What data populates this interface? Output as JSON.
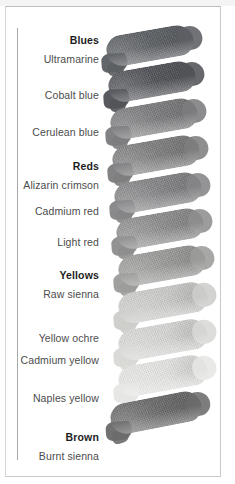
{
  "figure": {
    "title_visible": false,
    "background_color": "#ffffff",
    "frame_color": "#c9c9c9",
    "rule_color": "#a9a9a9",
    "label_color": "#4c4c4c",
    "group_label_color": "#1d1d1d"
  },
  "chart_data": {
    "type": "table",
    "title": "",
    "subtitle": "",
    "xlabel": "",
    "ylabel": "",
    "legend_position": "none",
    "grid": false,
    "categories": [
      "Ultramarine",
      "Cobalt blue",
      "Cerulean blue",
      "Alizarin crimson",
      "Cadmium red",
      "Light red",
      "Raw sienna",
      "Yellow ochre",
      "Cadmium yellow",
      "Naples yellow",
      "Burnt sienna"
    ],
    "groups": [
      "Blues",
      "Reds",
      "Yellows",
      "Brown"
    ],
    "series": [
      {
        "name": "swatch tone (0 = black, 255 = white)",
        "values": [
          92,
          82,
          124,
          126,
          133,
          142,
          156,
          205,
          216,
          230,
          107
        ]
      }
    ],
    "swatch_colors": [
      "#5c5f63",
      "#525358",
      "#7c7c7e",
      "#7e7e80",
      "#858587",
      "#8e8e8e",
      "#9c9c9a",
      "#cdcdcb",
      "#d8d8d6",
      "#e6e6e4",
      "#6b6b6b"
    ]
  },
  "rows": [
    {
      "group": "Blues",
      "name": "Ultramarine",
      "color": "#5c5f63",
      "top": 30
    },
    {
      "group": "",
      "name": "Cobalt blue",
      "color": "#525358",
      "top": 66
    },
    {
      "group": "",
      "name": "Cerulean blue",
      "color": "#7c7c7e",
      "top": 103
    },
    {
      "group": "Reds",
      "name": "Alizarin crimson",
      "color": "#7e7e80",
      "top": 140
    },
    {
      "group": "",
      "name": "Cadmium red",
      "color": "#858587",
      "top": 177
    },
    {
      "group": "",
      "name": "Light red",
      "color": "#8e8e8e",
      "top": 213
    },
    {
      "group": "Yellows",
      "name": "Raw sienna",
      "color": "#9c9c9a",
      "top": 250
    },
    {
      "group": "",
      "name": "Yellow ochre",
      "color": "#cdcdcb",
      "top": 287
    },
    {
      "group": "",
      "name": "Cadmium yellow",
      "color": "#d8d8d6",
      "top": 324
    },
    {
      "group": "",
      "name": "Naples yellow",
      "color": "#e6e6e4",
      "top": 360
    },
    {
      "group": "Brown",
      "name": "Burnt sienna",
      "color": "#6b6b6b",
      "top": 397
    }
  ],
  "labels": [
    {
      "text": "Blues",
      "top": 35,
      "group": true
    },
    {
      "text": "Ultramarine",
      "top": 54,
      "group": false
    },
    {
      "text": "Cobalt blue",
      "top": 90,
      "group": false
    },
    {
      "text": "Cerulean blue",
      "top": 127,
      "group": false
    },
    {
      "text": "Reds",
      "top": 161,
      "group": true
    },
    {
      "text": "Alizarin crimson",
      "top": 180,
      "group": false
    },
    {
      "text": "Cadmium red",
      "top": 206,
      "group": false
    },
    {
      "text": "Light red",
      "top": 237,
      "group": false
    },
    {
      "text": "Yellows",
      "top": 270,
      "group": true
    },
    {
      "text": "Raw sienna",
      "top": 289,
      "group": false
    },
    {
      "text": "Yellow ochre",
      "top": 333,
      "group": false
    },
    {
      "text": "Cadmium yellow",
      "top": 355,
      "group": false
    },
    {
      "text": "Naples yellow",
      "top": 393,
      "group": false
    },
    {
      "text": "Brown",
      "top": 432,
      "group": true
    },
    {
      "text": "Burnt sienna",
      "top": 451,
      "group": false
    }
  ]
}
